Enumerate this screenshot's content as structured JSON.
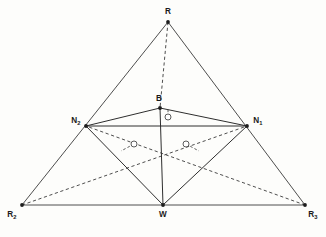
{
  "figure": {
    "background_color": "#fdfdfb",
    "line_color": "#3a3a3a",
    "vertices": [
      {
        "id": "R",
        "label": "R",
        "subscript": "",
        "x": 168,
        "y": 22,
        "label_x": 168,
        "label_y": 14,
        "anchor": "middle"
      },
      {
        "id": "N2",
        "label": "N",
        "subscript": "2",
        "x": 86,
        "y": 126,
        "label_x": 76,
        "label_y": 123,
        "anchor": "middle"
      },
      {
        "id": "N1",
        "label": "N",
        "subscript": "1",
        "x": 247,
        "y": 126,
        "label_x": 258,
        "label_y": 123,
        "anchor": "middle"
      },
      {
        "id": "B",
        "label": "B",
        "subscript": "",
        "x": 160,
        "y": 108,
        "label_x": 159,
        "label_y": 101,
        "anchor": "middle"
      },
      {
        "id": "W",
        "label": "W",
        "subscript": "",
        "x": 163,
        "y": 205,
        "label_x": 163,
        "label_y": 217,
        "anchor": "middle"
      },
      {
        "id": "R2",
        "label": "R",
        "subscript": "2",
        "x": 22,
        "y": 205,
        "label_x": 12,
        "label_y": 217,
        "anchor": "middle"
      },
      {
        "id": "R3",
        "label": "R",
        "subscript": "3",
        "x": 305,
        "y": 205,
        "label_x": 313,
        "label_y": 217,
        "anchor": "middle"
      }
    ],
    "solid_edges": [
      {
        "name": "edge-R-R2",
        "from": "R",
        "to": "R2"
      },
      {
        "name": "edge-R-R3",
        "from": "R",
        "to": "R3"
      },
      {
        "name": "edge-R2-R3",
        "from": "R2",
        "to": "R3"
      },
      {
        "name": "edge-N2-B",
        "from": "N2",
        "to": "B"
      },
      {
        "name": "edge-B-N1",
        "from": "B",
        "to": "N1"
      },
      {
        "name": "edge-N2-N1",
        "from": "N2",
        "to": "N1"
      },
      {
        "name": "edge-N2-W",
        "from": "N2",
        "to": "W"
      },
      {
        "name": "edge-N1-W",
        "from": "N1",
        "to": "W"
      },
      {
        "name": "edge-B-W",
        "from": "B",
        "to": "W"
      }
    ],
    "dashed_edges": [
      {
        "name": "edge-R-B-altitude",
        "from": "R",
        "to": "B"
      },
      {
        "name": "edge-R2-N1",
        "from": "R2",
        "to": "N1"
      },
      {
        "name": "edge-R3-N2",
        "from": "R3",
        "to": "N2"
      }
    ],
    "markers": [
      {
        "name": "marker-circle-apex",
        "x": 168,
        "y": 117,
        "r": 3.0
      },
      {
        "name": "marker-circle-left",
        "x": 134,
        "y": 144,
        "r": 3.0
      },
      {
        "name": "marker-circle-right",
        "x": 186,
        "y": 144,
        "r": 3.0
      }
    ]
  }
}
